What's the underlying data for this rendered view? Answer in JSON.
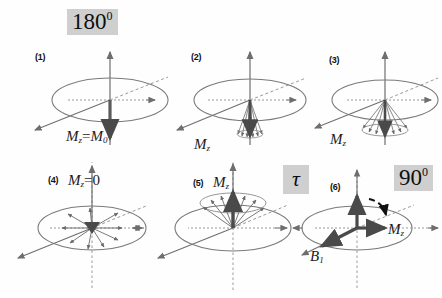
{
  "figure": {
    "colors": {
      "axis": "#6e6e6e",
      "ellipse": "#7a7a7a",
      "dashed": "#9a9a9a",
      "vector_main": "#4a4a4a",
      "vector_fan": "#6a6a6a",
      "badge_bg": "#cfcfcf",
      "text": "#111111",
      "background": "#ffffff"
    }
  },
  "badges": [
    {
      "id": "pulse-180",
      "value": "180",
      "sup": "0"
    },
    {
      "id": "delay-tau",
      "value": "τ",
      "sup": ""
    },
    {
      "id": "pulse-90",
      "value": "90",
      "sup": "0"
    }
  ],
  "panels": [
    {
      "id": "panel-1",
      "number": "(1)",
      "label": "M",
      "sub": "z",
      "equals": "=",
      "label2": "M",
      "sub2": "0",
      "state": "inverted-full",
      "description": "Net magnetization inverted along minus z after 180 degree pulse"
    },
    {
      "id": "panel-2",
      "number": "(2)",
      "label": "M",
      "sub": "z",
      "equals": "",
      "label2": "",
      "sub2": "",
      "state": "cone-narrow-down",
      "description": "Spins dephasing in a narrow cone pointing down"
    },
    {
      "id": "panel-3",
      "number": "(3)",
      "label": "M",
      "sub": "z",
      "equals": "",
      "label2": "",
      "sub2": "",
      "state": "cone-wide-down",
      "description": "Spins spreading in a wider cone pointing down"
    },
    {
      "id": "panel-4",
      "number": "(4)",
      "label": "M",
      "sub": "z",
      "equals": "=",
      "label2": "0",
      "sub2": "",
      "state": "isotropic-zero",
      "description": "Magnetization nulled, spins isotropic in plane"
    },
    {
      "id": "panel-5",
      "number": "(5)",
      "label": "M",
      "sub": "z",
      "equals": "",
      "label2": "",
      "sub2": "",
      "state": "cone-up",
      "description": "Magnetization recovering upward as a cone of spins"
    },
    {
      "id": "panel-6",
      "number": "(6)",
      "label": "M",
      "sub": "z",
      "equals": "",
      "label2": "",
      "sub2": "",
      "state": "tipped-90",
      "description": "After 90 degree pulse magnetization tipped into transverse plane",
      "extra_label": "B",
      "extra_sub": "1"
    }
  ]
}
